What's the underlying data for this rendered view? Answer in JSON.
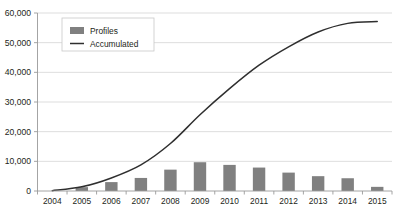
{
  "chart_data": {
    "type": "bar",
    "title": "",
    "subtitle": "",
    "xlabel": "",
    "ylabel": "",
    "categories": [
      "2004",
      "2005",
      "2006",
      "2007",
      "2008",
      "2009",
      "2010",
      "2011",
      "2012",
      "2013",
      "2014",
      "2015"
    ],
    "series": [
      {
        "name": "Profiles",
        "type": "bar",
        "color": "#808080",
        "values": [
          0,
          1300,
          3000,
          4400,
          7200,
          9700,
          8800,
          7900,
          6200,
          5000,
          4300,
          1400
        ]
      },
      {
        "name": "Accumulated",
        "type": "line",
        "color": "#2f2f2f",
        "values": [
          100,
          1400,
          4400,
          8800,
          16000,
          25700,
          34500,
          42400,
          48600,
          53600,
          56500,
          57100
        ]
      }
    ],
    "ylim": [
      0,
      60000
    ],
    "ytick_values": [
      0,
      10000,
      20000,
      30000,
      40000,
      50000,
      60000
    ],
    "ytick_labels": [
      "0",
      "10,000",
      "20,000",
      "30,000",
      "40,000",
      "50,000",
      "60,000"
    ],
    "grid": true,
    "grid_axis": "y",
    "legend": {
      "position": "upper-left-inside",
      "entries": [
        {
          "label": "Profiles",
          "marker": "bar-swatch",
          "color": "#808080"
        },
        {
          "label": "Accumulated",
          "marker": "line-swatch",
          "color": "#2f2f2f"
        }
      ]
    },
    "colors": {
      "background": "#ffffff",
      "gridline": "#d4d4d4",
      "axis": "#9a9a9a",
      "text": "#231f20"
    }
  }
}
